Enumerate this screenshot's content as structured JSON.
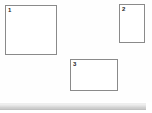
{
  "canvas": {
    "background_color": "#fefefe",
    "border_color": "#8a8a8a",
    "boxes": [
      {
        "id": "box-1",
        "label": "1",
        "shape": "square",
        "x": 5,
        "y": 5,
        "width": 52,
        "height": 50
      },
      {
        "id": "box-2",
        "label": "2",
        "shape": "portrait-rectangle",
        "x": 119,
        "y": 4,
        "width": 26,
        "height": 39
      },
      {
        "id": "box-3",
        "label": "3",
        "shape": "landscape-rectangle",
        "x": 70,
        "y": 59,
        "width": 48,
        "height": 32
      }
    ]
  },
  "scrollbar": {
    "orientation": "horizontal",
    "track_color": "#ffffff",
    "thumb_color": "#d2d2d2",
    "thumb_width": 146
  }
}
